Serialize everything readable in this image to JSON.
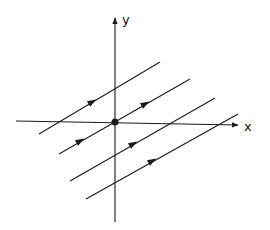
{
  "diagram": {
    "type": "phase-portrait",
    "stroke_color": "#1a1a1a",
    "background": "#ffffff",
    "axes": {
      "x": {
        "label": "x",
        "from": [
          16,
          121
        ],
        "to": [
          238,
          125
        ],
        "label_pos": [
          244,
          131
        ]
      },
      "y": {
        "label": "y",
        "from": [
          115,
          222
        ],
        "to": [
          115,
          18
        ],
        "label_pos": [
          122,
          24
        ]
      }
    },
    "origin_point": {
      "cx": 115,
      "cy": 122,
      "r": 3.5
    },
    "trajectories": [
      {
        "from": [
          39,
          134
        ],
        "to": [
          160,
          62
        ],
        "arrows": [
          [
            92,
            102
          ]
        ]
      },
      {
        "from": [
          59,
          154
        ],
        "to": [
          190,
          79
        ],
        "arrows": [
          [
            80,
            141
          ],
          [
            145,
            104
          ]
        ]
      },
      {
        "from": [
          70,
          181
        ],
        "to": [
          215,
          98
        ],
        "arrows": [
          [
            133,
            144
          ]
        ]
      },
      {
        "from": [
          86,
          199
        ],
        "to": [
          238,
          114
        ],
        "arrows": [
          [
            152,
            161
          ]
        ]
      }
    ]
  }
}
